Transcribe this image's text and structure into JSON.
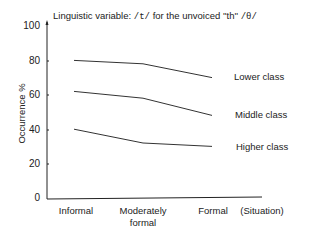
{
  "chart_data": {
    "type": "line",
    "title_parts": {
      "prefix": "Linguistic variable: ",
      "phoneme": "/t/",
      "middle": " for the unvoiced ''th'' ",
      "target": "/θ/"
    },
    "xlabel": "(Situation)",
    "ylabel": "Occurrence %",
    "categories": [
      "Informal",
      "Moderately formal",
      "Formal"
    ],
    "ylim": [
      0,
      100
    ],
    "yticks": [
      0,
      20,
      40,
      60,
      80,
      100
    ],
    "grid": false,
    "legend_position": "inline-right",
    "series": [
      {
        "name": "Lower class",
        "values": [
          80,
          78,
          70
        ]
      },
      {
        "name": "Middle class",
        "values": [
          62,
          58,
          48
        ]
      },
      {
        "name": "Higher class",
        "values": [
          40,
          32,
          30
        ]
      }
    ]
  },
  "labels": {
    "x_categories": [
      "Informal",
      "Moderately",
      "formal",
      "Formal"
    ],
    "y_ticks": [
      "100",
      "80",
      "60",
      "40",
      "20",
      "0"
    ]
  }
}
